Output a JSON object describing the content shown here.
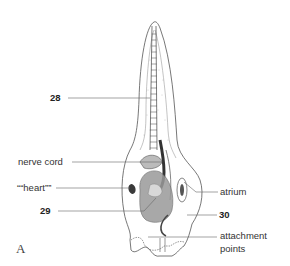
{
  "figure": {
    "panel_letter": "A",
    "labels": {
      "n28": "28",
      "nerve_cord": "nerve cord",
      "heart": "““heart””",
      "n29": "29",
      "atrium": "atrium",
      "n30": "30",
      "attachment_line1": "attachment",
      "attachment_line2": "points"
    },
    "colors": {
      "outline": "#555555",
      "leader_line": "#666666",
      "text": "#333333",
      "dark_fill": "#3a3a3a",
      "shading": "#9a9a9a"
    }
  }
}
